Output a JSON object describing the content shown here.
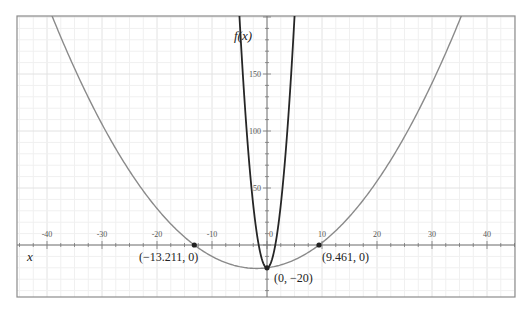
{
  "chart_data": {
    "type": "line",
    "title": "",
    "xlabel": "x",
    "ylabel": "f(x)",
    "xlim": [
      -45.5,
      45
    ],
    "ylim": [
      -45,
      201
    ],
    "grid": true,
    "x_ticks": [
      -40,
      -30,
      -20,
      -10,
      0,
      10,
      20,
      30,
      40
    ],
    "x_tick_labels": [
      "-40",
      "-30",
      "-20",
      "-10",
      "0",
      "10",
      "20",
      "30",
      "40"
    ],
    "y_ticks": [
      50,
      100,
      150
    ],
    "y_tick_labels": [
      "50",
      "100",
      "150"
    ],
    "series": [
      {
        "name": "narrow parabola (dark)",
        "color": "#2b2b2b",
        "x": [
          -5,
          -4,
          -3,
          -2,
          -1,
          0,
          1,
          2,
          3,
          4,
          5
        ],
        "y": [
          200,
          120.8,
          59.2,
          15.2,
          -11.2,
          -20,
          -11.2,
          15.2,
          59.2,
          120.8,
          200
        ]
      },
      {
        "name": "wide parabola (gray)",
        "color": "#8a8a8a",
        "x": [
          -40,
          -30,
          -20,
          -13.211,
          -10,
          0,
          9.461,
          10,
          20,
          30,
          36
        ],
        "y": [
          155,
          72.7,
          21.6,
          0,
          -10.1,
          -20,
          0,
          1.4,
          56.4,
          131.4,
          190.3
        ]
      }
    ],
    "annotations": [
      {
        "label": "(−13.211, 0)",
        "x": -13.211,
        "y": 0
      },
      {
        "label": "(9.461, 0)",
        "x": 9.461,
        "y": 0
      },
      {
        "label": "(0, −20)",
        "x": 0,
        "y": -20
      }
    ]
  },
  "axes": {
    "x_title": "x",
    "y_title": "f(x)",
    "x_ticks": [
      "-40",
      "-30",
      "-20",
      "-10",
      "0",
      "10",
      "20",
      "30",
      "40"
    ],
    "y_ticks": [
      "50",
      "100",
      "150"
    ]
  },
  "points": {
    "root_left": "(−13.211, 0)",
    "root_right": "(9.461, 0)",
    "vertex": "(0, −20)"
  }
}
